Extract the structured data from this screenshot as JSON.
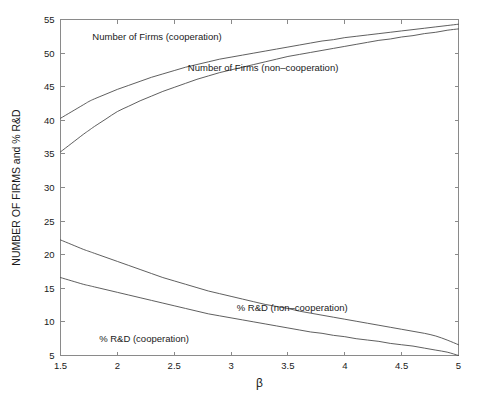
{
  "figure": {
    "background_color": "#ffffff",
    "axis_color": "#8a8a8a",
    "curve_color": "#4d4d4d",
    "text_color": "#1a1a1a"
  },
  "chart_data": {
    "type": "line",
    "title": "",
    "subtitle": "",
    "xlabel": "β",
    "ylabel": "NUMBER OF FIRMS and % R&D",
    "xlim": [
      1.5,
      5
    ],
    "ylim": [
      5,
      55
    ],
    "grid": false,
    "legend_position": "inline-annotations",
    "xticks": [
      1.5,
      2,
      2.5,
      3,
      3.5,
      4,
      4.5,
      5
    ],
    "xtick_labels": [
      "1.5",
      "2",
      "2.5",
      "3",
      "3.5",
      "4",
      "4.5",
      "5"
    ],
    "yticks": [
      5,
      10,
      15,
      20,
      25,
      30,
      35,
      40,
      45,
      50,
      55
    ],
    "ytick_labels": [
      "5",
      "10",
      "15",
      "20",
      "25",
      "30",
      "35",
      "40",
      "45",
      "50",
      "55"
    ],
    "x": [
      1.5,
      1.6,
      1.7,
      1.75,
      1.8,
      1.9,
      2.0,
      2.1,
      2.2,
      2.3,
      2.4,
      2.5,
      2.6,
      2.7,
      2.8,
      2.9,
      3.0,
      3.1,
      3.2,
      3.3,
      3.4,
      3.5,
      3.6,
      3.7,
      3.8,
      3.9,
      4.0,
      4.1,
      4.2,
      4.3,
      4.4,
      4.5,
      4.6,
      4.7,
      4.8,
      4.9,
      5.0
    ],
    "series": [
      {
        "name": "Number of Firms (cooperation)",
        "label": "Number of Firms (cooperation)",
        "label_x": 1.78,
        "label_y": 52.0,
        "values": [
          40.3,
          41.3,
          42.3,
          42.8,
          43.2,
          43.9,
          44.6,
          45.2,
          45.8,
          46.4,
          46.9,
          47.4,
          47.9,
          48.3,
          48.7,
          49.1,
          49.4,
          49.7,
          50.0,
          50.3,
          50.6,
          50.9,
          51.2,
          51.5,
          51.8,
          52.0,
          52.3,
          52.5,
          52.7,
          52.9,
          53.1,
          53.3,
          53.5,
          53.7,
          53.9,
          54.1,
          54.3
        ]
      },
      {
        "name": "Number of Firms (non-cooperation)",
        "label": "Number of Firms (non–cooperation)",
        "label_x": 2.62,
        "label_y": 47.3,
        "values": [
          35.3,
          36.6,
          37.9,
          38.5,
          39.1,
          40.2,
          41.3,
          42.1,
          42.9,
          43.6,
          44.3,
          44.9,
          45.5,
          46.1,
          46.6,
          47.1,
          47.5,
          47.9,
          48.3,
          48.7,
          49.1,
          49.5,
          49.8,
          50.1,
          50.4,
          50.7,
          51.0,
          51.3,
          51.6,
          51.9,
          52.1,
          52.4,
          52.6,
          52.9,
          53.1,
          53.4,
          53.6
        ]
      },
      {
        "name": "% R&D (non-cooperation)",
        "label": "% R&D (non–cooperation)",
        "label_x": 3.05,
        "label_y": 11.6,
        "values": [
          22.2,
          21.5,
          20.8,
          20.5,
          20.2,
          19.6,
          19.0,
          18.4,
          17.8,
          17.2,
          16.6,
          16.1,
          15.6,
          15.1,
          14.6,
          14.2,
          13.8,
          13.4,
          13.0,
          12.6,
          12.3,
          12.0,
          11.6,
          11.3,
          11.0,
          10.7,
          10.4,
          10.1,
          9.8,
          9.5,
          9.2,
          8.9,
          8.6,
          8.3,
          7.9,
          7.3,
          6.6
        ]
      },
      {
        "name": "% R&D (cooperation)",
        "label": "% R&D (cooperation)",
        "label_x": 1.84,
        "label_y": 7.0,
        "values": [
          16.6,
          16.1,
          15.6,
          15.4,
          15.2,
          14.8,
          14.4,
          14.0,
          13.6,
          13.2,
          12.8,
          12.4,
          12.0,
          11.6,
          11.2,
          10.9,
          10.6,
          10.3,
          10.0,
          9.7,
          9.4,
          9.1,
          8.8,
          8.5,
          8.3,
          8.0,
          7.8,
          7.5,
          7.3,
          7.1,
          6.8,
          6.6,
          6.4,
          6.1,
          5.8,
          5.5,
          5.0
        ]
      }
    ]
  }
}
